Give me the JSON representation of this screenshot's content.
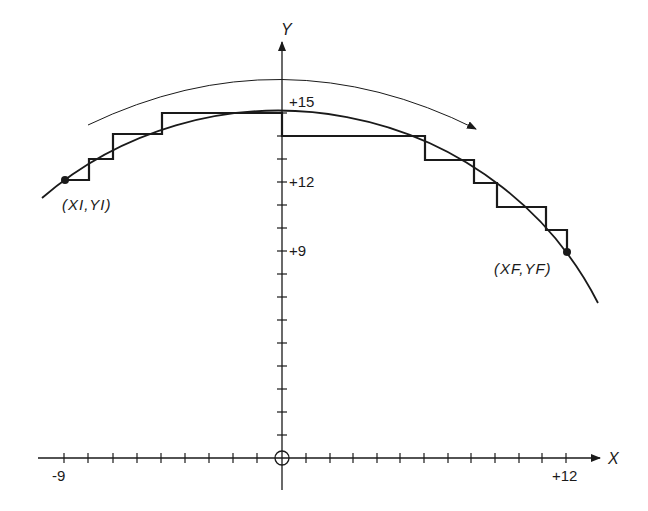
{
  "figure": {
    "type": "circular-arc staircase approximation (clockwise)",
    "axes": {
      "x_label": "X",
      "y_label": "Y",
      "x_tick_labels": [
        "-9",
        "+12"
      ],
      "y_tick_labels": [
        "+15",
        "+12",
        "+9"
      ],
      "origin_marker": "circle",
      "x_range": [
        -9,
        12
      ],
      "y_range": [
        0,
        15
      ]
    },
    "points": {
      "start_label": "(XI,YI)",
      "end_label": "(XF,YF)"
    },
    "direction_arrow": "clockwise",
    "circle": {
      "center": [
        0,
        0
      ],
      "radius": 15
    },
    "colors": {
      "ink": "#1a1a1a",
      "background": "#ffffff"
    }
  }
}
